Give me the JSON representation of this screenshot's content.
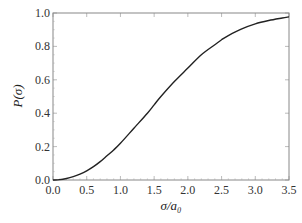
{
  "chart_data": {
    "type": "line",
    "title": "",
    "xlabel": "σ/a₀",
    "ylabel": "P(σ)",
    "xlim": [
      0.0,
      3.5
    ],
    "ylim": [
      0.0,
      1.0
    ],
    "grid": false,
    "legend": null,
    "x_ticks": [
      "0.0",
      "0.5",
      "1.0",
      "1.5",
      "2.0",
      "2.5",
      "3.0",
      "3.5"
    ],
    "y_ticks": [
      "0.0",
      "0.2",
      "0.4",
      "0.6",
      "0.8",
      "1.0"
    ],
    "series": [
      {
        "name": "P(σ)",
        "color": "#222222",
        "x": [
          0.0,
          0.1,
          0.2,
          0.3,
          0.4,
          0.5,
          0.6,
          0.7,
          0.8,
          0.9,
          1.0,
          1.2,
          1.4,
          1.5,
          1.6,
          1.8,
          2.0,
          2.2,
          2.4,
          2.5,
          2.6,
          2.8,
          3.0,
          3.2,
          3.4,
          3.5
        ],
        "values": [
          0.0,
          0.002,
          0.009,
          0.02,
          0.035,
          0.055,
          0.08,
          0.11,
          0.145,
          0.18,
          0.22,
          0.31,
          0.4,
          0.45,
          0.5,
          0.59,
          0.67,
          0.75,
          0.81,
          0.84,
          0.865,
          0.905,
          0.935,
          0.955,
          0.97,
          0.977
        ]
      }
    ]
  }
}
